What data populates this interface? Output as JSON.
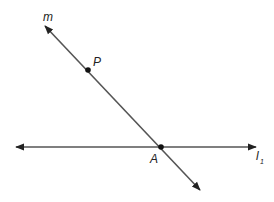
{
  "diagram": {
    "lines": [
      {
        "name": "m",
        "label": "m",
        "from": [
          45,
          26
        ],
        "to": [
          200,
          190
        ]
      },
      {
        "name": "l1",
        "label": "l",
        "subscript": "1",
        "from": [
          16,
          147
        ],
        "to": [
          256,
          147
        ]
      }
    ],
    "points": [
      {
        "name": "P",
        "label": "P",
        "at": [
          88,
          70
        ]
      },
      {
        "name": "A",
        "label": "A",
        "at": [
          161,
          147
        ]
      }
    ],
    "colors": {
      "line": "#555555",
      "point": "#111111",
      "text": "#222222"
    }
  }
}
